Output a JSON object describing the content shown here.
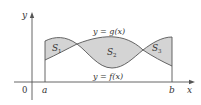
{
  "diagram": {
    "type": "area-between-curves",
    "axes": {
      "x_label": "x",
      "y_label": "y",
      "origin_label": "0"
    },
    "bounds": {
      "left_label": "a",
      "right_label": "b"
    },
    "curves": {
      "upper_label": "y = g(x)",
      "lower_label": "y = f(x)"
    },
    "regions": [
      {
        "label": "S",
        "subscript": "1"
      },
      {
        "label": "S",
        "subscript": "2"
      },
      {
        "label": "S",
        "subscript": "3"
      }
    ],
    "colors": {
      "region_fill": "#d4d4d4",
      "stroke": "#555555",
      "background": "#ffffff"
    }
  }
}
